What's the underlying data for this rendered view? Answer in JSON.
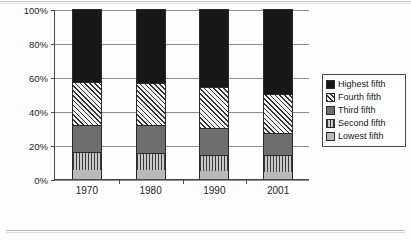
{
  "chart_data": {
    "type": "bar",
    "title": "",
    "subtitle": "",
    "xlabel": "",
    "ylabel": "",
    "stacked": true,
    "grid": true,
    "legend_position": "right",
    "ylim": [
      0,
      100
    ],
    "yticks": [
      "0%",
      "20%",
      "40%",
      "60%",
      "80%",
      "100%"
    ],
    "ytick_values": [
      0,
      20,
      40,
      60,
      80,
      100
    ],
    "categories": [
      "1970",
      "1980",
      "1990",
      "2001"
    ],
    "series": [
      {
        "name": "Lowest fifth",
        "pattern": "light-gray",
        "values": [
          5.5,
          5.5,
          4.5,
          4.0
        ]
      },
      {
        "name": "Second fifth",
        "pattern": "vertical-stripe",
        "values": [
          10.5,
          10.0,
          9.5,
          10.0
        ]
      },
      {
        "name": "Third fifth",
        "pattern": "solid-gray",
        "values": [
          16.0,
          16.0,
          16.0,
          13.0
        ]
      },
      {
        "name": "Fourth fifth",
        "pattern": "diagonal-hatch",
        "values": [
          25.0,
          25.0,
          24.0,
          23.0
        ]
      },
      {
        "name": "Highest fifth",
        "pattern": "solid-black",
        "values": [
          43.0,
          43.5,
          46.0,
          50.0
        ]
      }
    ],
    "cumulative_tops": {
      "1970": [
        5.5,
        16.0,
        32.0,
        57.0,
        100.0
      ],
      "1980": [
        5.5,
        15.5,
        31.5,
        56.5,
        100.0
      ],
      "1990": [
        4.5,
        14.0,
        30.0,
        54.0,
        100.0
      ],
      "2001": [
        4.0,
        14.0,
        27.0,
        50.0,
        100.0
      ]
    }
  },
  "legend": {
    "items": [
      {
        "label": "Highest fifth"
      },
      {
        "label": "Fourth fifth"
      },
      {
        "label": "Third fifth"
      },
      {
        "label": "Second fifth"
      },
      {
        "label": "Lowest fifth"
      }
    ]
  },
  "colors": {
    "highest_fifth": "#181818",
    "third_fifth": "#6e6e6e",
    "lowest_fifth": "#b9b9b9",
    "axis": "#4a4a4a",
    "gridline": "#8d8d8d"
  }
}
